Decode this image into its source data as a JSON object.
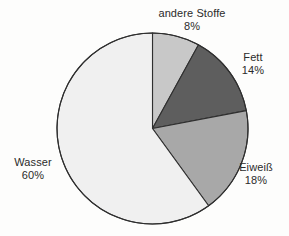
{
  "chart_data": {
    "type": "pie",
    "title": "",
    "subtitle": "",
    "xlabel": "",
    "ylabel": "",
    "legend_position": "none",
    "grid": false,
    "units": "percent",
    "start_angle_deg": 0,
    "direction": "clockwise",
    "categories": [
      "andere Stoffe",
      "Fett",
      "Eiweiß",
      "Wasser"
    ],
    "values": [
      8,
      14,
      18,
      60
    ],
    "labels": [
      "8%",
      "14%",
      "18%",
      "60%"
    ],
    "colors": [
      "#c8c8c8",
      "#5e5e5e",
      "#a8a8a8",
      "#f0f0f0"
    ],
    "slices": [
      {
        "name": "andere Stoffe",
        "value": 8,
        "label": "8%",
        "color": "#c8c8c8",
        "start_deg": 0.0,
        "end_deg": 28.8
      },
      {
        "name": "Fett",
        "value": 14,
        "label": "14%",
        "color": "#5e5e5e",
        "start_deg": 28.8,
        "end_deg": 79.2
      },
      {
        "name": "Eiweiß",
        "value": 18,
        "label": "18%",
        "color": "#a8a8a8",
        "start_deg": 79.2,
        "end_deg": 144.0
      },
      {
        "name": "Wasser",
        "value": 60,
        "label": "60%",
        "color": "#f0f0f0",
        "start_deg": 144.0,
        "end_deg": 360.0
      }
    ]
  },
  "geometry": {
    "center_x": 152.5,
    "center_y": 128.5,
    "radius": 95.5,
    "stroke_color": "#2f2f2f",
    "stroke_width": 1.1
  },
  "labels": {
    "andere_stoffe": {
      "name": "andere Stoffe",
      "percent": "8%"
    },
    "fett": {
      "name": "Fett",
      "percent": "14%"
    },
    "eiweiss": {
      "name": "Eiweiß",
      "percent": "18%"
    },
    "wasser": {
      "name": "Wasser",
      "percent": "60%"
    }
  },
  "style": {
    "background": "#fdfdfc",
    "text_color": "#2b2b2b"
  }
}
